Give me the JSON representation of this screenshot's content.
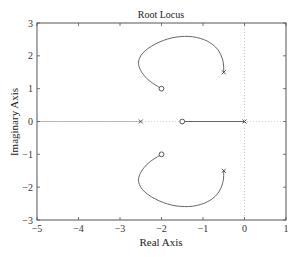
{
  "chart_data": {
    "type": "line",
    "title": "Root Locus",
    "xlabel": "Real Axis",
    "ylabel": "Imaginary Axis",
    "xlim": [
      -5,
      1
    ],
    "ylim": [
      -3,
      3
    ],
    "xticks": [
      "-5",
      "-4",
      "-3",
      "-2",
      "-1",
      "0",
      "1"
    ],
    "xtick_values": [
      -5,
      -4,
      -3,
      -2,
      -1,
      0,
      1
    ],
    "yticks": [
      "3",
      "2",
      "1",
      "0",
      "-1",
      "-2",
      "-3"
    ],
    "ytick_values": [
      3,
      2,
      1,
      0,
      -1,
      -2,
      -3
    ],
    "grid": false,
    "reference_lines": {
      "x": 0,
      "y": 0
    },
    "poles": [
      [
        -2.5,
        0
      ],
      [
        0,
        0
      ],
      [
        -0.5,
        1.5
      ],
      [
        -0.5,
        -1.5
      ]
    ],
    "zeros": [
      [
        -1.5,
        0
      ],
      [
        -2,
        1
      ],
      [
        -2,
        -1
      ]
    ],
    "series": [
      {
        "name": "branch-upper",
        "points": [
          [
            -0.5,
            1.5
          ],
          [
            -0.52,
            1.85
          ],
          [
            -0.65,
            2.2
          ],
          [
            -0.9,
            2.45
          ],
          [
            -1.25,
            2.58
          ],
          [
            -1.65,
            2.57
          ],
          [
            -2.05,
            2.42
          ],
          [
            -2.4,
            2.15
          ],
          [
            -2.55,
            1.85
          ],
          [
            -2.5,
            1.55
          ],
          [
            -2.3,
            1.25
          ],
          [
            -2.0,
            1.0
          ]
        ]
      },
      {
        "name": "branch-lower",
        "points": [
          [
            -0.5,
            -1.5
          ],
          [
            -0.52,
            -1.85
          ],
          [
            -0.65,
            -2.2
          ],
          [
            -0.9,
            -2.45
          ],
          [
            -1.25,
            -2.58
          ],
          [
            -1.65,
            -2.57
          ],
          [
            -2.05,
            -2.42
          ],
          [
            -2.4,
            -2.15
          ],
          [
            -2.55,
            -1.85
          ],
          [
            -2.5,
            -1.55
          ],
          [
            -2.3,
            -1.25
          ],
          [
            -2.0,
            -1.0
          ]
        ]
      },
      {
        "name": "branch-real-right",
        "points": [
          [
            0,
            0
          ],
          [
            -1.5,
            0
          ]
        ]
      },
      {
        "name": "branch-real-left",
        "points": [
          [
            -2.5,
            0
          ],
          [
            -5,
            0
          ]
        ]
      }
    ]
  }
}
